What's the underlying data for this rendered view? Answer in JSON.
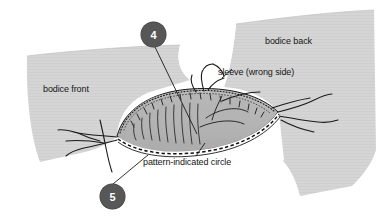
{
  "figure": {
    "type": "sewing-instruction-diagram",
    "background_color": "#ffffff"
  },
  "labels": {
    "bodice_front": "bodice front",
    "bodice_back": "bodice back",
    "sleeve": "sleeve (wrong side)",
    "pattern_circle": "pattern-indicated circle"
  },
  "callouts": [
    {
      "number": "4",
      "target": "sleeve cap gathering area"
    },
    {
      "number": "5",
      "target": "basted seam line at sleeve underarm"
    }
  ],
  "colors": {
    "bodice_fabric": "#d4d4d4",
    "bodice_fabric_shade": "#c9c9c9",
    "sleeve_fabric": "#b6b6b6",
    "sleeve_fabric_shade": "#a8a8a8",
    "outline": "#1a1a1a",
    "badge_fill": "#575757",
    "badge_text": "#ffffff",
    "leader_line": "#1a1a1a",
    "background": "#ffffff"
  },
  "elements": {
    "bodice_front_panel": "bodice front fabric panel",
    "bodice_back_panel": "bodice back fabric panel",
    "sleeve_cap": "sleeve cap lens shape",
    "armhole_notch": "white armhole notch between panels",
    "gathering_stitches": "short tick marks inside sleeve cap",
    "dotted_stitch_edge": "dotted stitching along upper sleeve cap edge",
    "basting_line": "dashed basting line along lower sleeve edge",
    "thread_tails": "loose thread tails at sleeve ends",
    "speck": "small gray speck artifact"
  }
}
